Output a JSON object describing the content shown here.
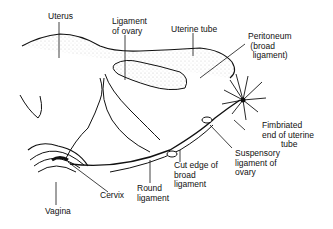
{
  "diagram": {
    "labels": {
      "uterus": "Uterus",
      "ligament_of_ovary": "Ligament\nof ovary",
      "uterine_tube": "Uterine tube",
      "peritoneum": "Peritoneum\n (broad\n  ligament)",
      "fimbriated_end": "Fimbriated\nend of uterine\n        tube",
      "suspensory_ligament": "Suspensory\nligament of\novary",
      "cut_edge": "Cut edge of\nbroad\nligament",
      "round_ligament": "Round\nligament",
      "cervix": "Cervix",
      "vagina": "Vagina"
    }
  }
}
